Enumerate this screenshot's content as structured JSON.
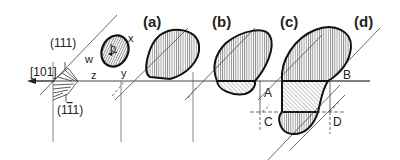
{
  "diagram": {
    "directions": {
      "slip_direction": "[101]",
      "plane_top": "(111)",
      "plane_bottom_prefix": "(1",
      "plane_bottom_bar": "1",
      "plane_bottom_suffix": "1)"
    },
    "loop_labels": {
      "x": "x",
      "y": "y",
      "z": "z",
      "w": "w",
      "burgers": "b"
    },
    "panels": [
      {
        "id": "a",
        "label": "(a)"
      },
      {
        "id": "b",
        "label": "(b)"
      },
      {
        "id": "c",
        "label": "(c)"
      },
      {
        "id": "d",
        "label": "(d)"
      }
    ],
    "points": {
      "A": "A",
      "B": "B",
      "C": "C",
      "D": "D"
    },
    "colors": {
      "line": "#222222",
      "hatch": "#555555",
      "background": "#ffffff"
    }
  }
}
